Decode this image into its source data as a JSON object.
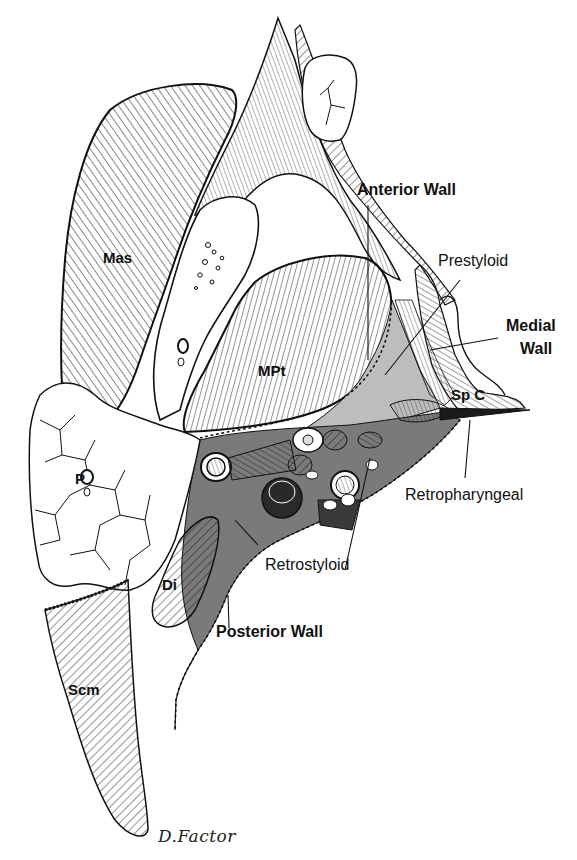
{
  "figure": {
    "type": "anatomical-illustration",
    "colors": {
      "line": "#111111",
      "background": "#ffffff",
      "retrostyloid_fill": "#7a7a7a",
      "prestyloid_fill": "#bdbdbd",
      "vessel_fill": "#2a2a2a"
    }
  },
  "labels": {
    "anterior_wall": "Anterior Wall",
    "prestyloid": "Prestyloid",
    "medial_wall_line1": "Medial",
    "medial_wall_line2": "Wall",
    "sp_c": "Sp C",
    "retropharyngeal": "Retropharyngeal",
    "retrostyloid": "Retrostyloid",
    "posterior_wall": "Posterior Wall",
    "mas": "Mas",
    "mpt": "MPt",
    "p": "P",
    "di": "Di",
    "scm": "Scm"
  },
  "signature": "D.Factor"
}
